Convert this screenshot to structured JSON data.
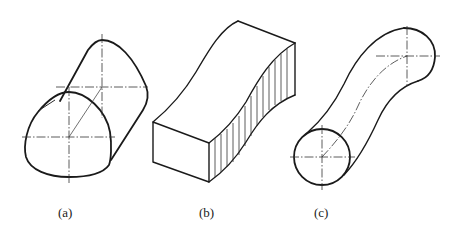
{
  "figure": {
    "panels": [
      {
        "id": "a",
        "label": "(a)",
        "description": "oblique cylinder with egg-shaped (rounded triangular) cross-section"
      },
      {
        "id": "b",
        "label": "(b)",
        "description": "rectangular block swept along curved (S-shaped) path with hatched side face"
      },
      {
        "id": "c",
        "label": "(c)",
        "description": "circular cross-section swept along S-curve with dash-dot centerline"
      }
    ],
    "colors": {
      "line": "#1a1a1a",
      "background": "#ffffff"
    }
  }
}
